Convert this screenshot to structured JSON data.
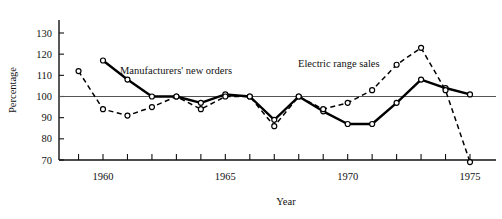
{
  "figure": {
    "title": "",
    "ylabel": "Percentage",
    "xlabel": "Year"
  },
  "annotations": {
    "manufacturers": "Manufacturers' new orders",
    "electric_range": "Electric range sales"
  },
  "chart_data": {
    "type": "line",
    "title": "",
    "xlabel": "Year",
    "ylabel": "Percentage",
    "xlim": [
      1958.5,
      1975.5
    ],
    "ylim": [
      69,
      134
    ],
    "yticks": [
      70,
      80,
      90,
      100,
      110,
      120,
      130
    ],
    "ytick_labels": [
      "70",
      "80",
      "90",
      "100",
      "110",
      "120",
      "130"
    ],
    "xticks": [
      1959,
      1960,
      1961,
      1962,
      1963,
      1964,
      1965,
      1966,
      1967,
      1968,
      1969,
      1970,
      1971,
      1972,
      1973,
      1974,
      1975
    ],
    "xtick_labels_shown": [
      "1960",
      "1965",
      "1970",
      "1975"
    ],
    "xtick_labels_shown_at": [
      1960,
      1965,
      1970,
      1975
    ],
    "grid": false,
    "reference_line": {
      "y": 100,
      "label": "100"
    },
    "legend_position": "inline-annotation",
    "series": [
      {
        "name": "Manufacturers' new orders",
        "style": "solid",
        "marker": "open-circle",
        "x": [
          1960,
          1961,
          1962,
          1963,
          1964,
          1965,
          1966,
          1967,
          1968,
          1969,
          1970,
          1971,
          1972,
          1973,
          1974,
          1975
        ],
        "values": [
          117,
          108,
          100,
          100,
          97,
          101,
          100,
          89,
          100,
          93,
          87,
          87,
          97,
          108,
          104,
          101
        ]
      },
      {
        "name": "Electric range sales",
        "style": "dashed",
        "marker": "open-circle",
        "x": [
          1959,
          1960,
          1961,
          1962,
          1963,
          1964,
          1965,
          1966,
          1967,
          1968,
          1969,
          1970,
          1971,
          1972,
          1973,
          1974,
          1975
        ],
        "values": [
          112,
          94,
          91,
          95,
          100,
          94,
          100,
          100,
          86,
          100,
          94,
          97,
          103,
          115,
          123,
          103,
          69
        ]
      }
    ]
  }
}
